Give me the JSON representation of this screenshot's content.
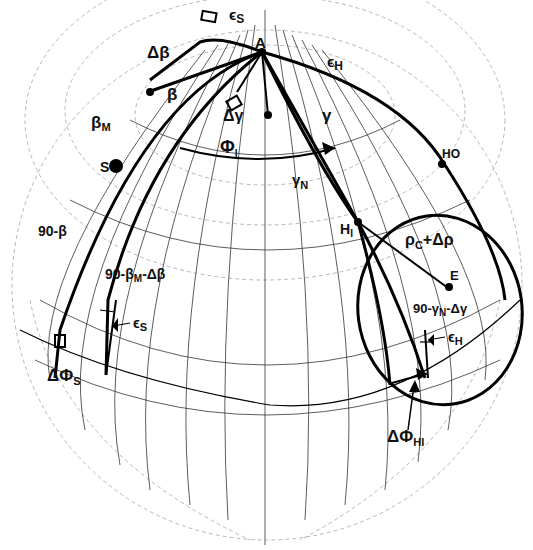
{
  "diagram": {
    "type": "celestial-sphere geometry diagram",
    "colors": {
      "ink": "#000000",
      "grid": "#333333",
      "background": "#ffffff"
    },
    "points": {
      "A": "A",
      "S": "S",
      "HI": "H",
      "HI_sub": "I",
      "HO": "HO",
      "E": "E"
    },
    "labels": {
      "epsilon_s_top": "ϵ",
      "epsilon_s_top_sub": "S",
      "delta_beta": "Δβ",
      "epsilon_h_top": "ϵ",
      "epsilon_h_top_sub": "H",
      "beta": "β",
      "beta_m": "β",
      "beta_m_sub": "M",
      "delta_gamma": "Δγ",
      "gamma": "γ",
      "phi_i": "Φ",
      "phi_i_sub": "I",
      "gamma_n": "γ",
      "gamma_n_sub": "N",
      "ninety_beta": "90-β",
      "ninety_beta_m_delta_beta_a": "90-β",
      "ninety_beta_m_delta_beta_sub": "M",
      "ninety_beta_m_delta_beta_b": "-Δβ",
      "epsilon_s_low": "ϵ",
      "epsilon_s_low_sub": "S",
      "delta_phi_s": "ΔΦ",
      "delta_phi_s_sub": "S",
      "rho_c": "ρ",
      "rho_c_sub": "C",
      "rho_plus": "+Δρ",
      "ninety_gamma_a": "90-γ",
      "ninety_gamma_sub": "N",
      "ninety_gamma_b": "-Δγ",
      "epsilon_h_low": "ϵ",
      "epsilon_h_low_sub": "H",
      "delta_phi_hi": "ΔΦ",
      "delta_phi_hi_sub": "HI"
    }
  }
}
